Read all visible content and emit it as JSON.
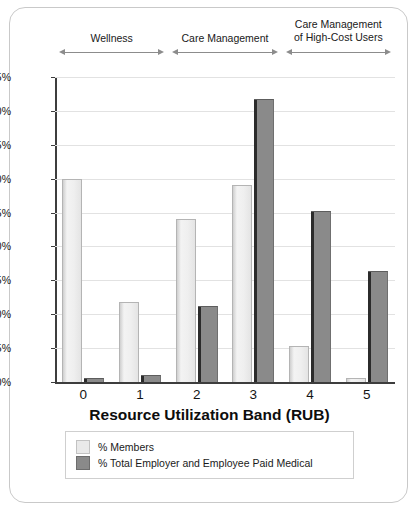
{
  "chart_data": {
    "type": "bar",
    "title": "",
    "xlabel": "Resource Utilization Band (RUB)",
    "ylabel": "",
    "categories": [
      "0",
      "1",
      "2",
      "3",
      "4",
      "5"
    ],
    "ylim": [
      0,
      45
    ],
    "ytick_labels": [
      "45%",
      "40%",
      "35%",
      "30%",
      "25%",
      "20%",
      "15%",
      "10%",
      "5%",
      "0%"
    ],
    "ytick_values": [
      45,
      40,
      35,
      30,
      25,
      20,
      15,
      10,
      5,
      0
    ],
    "grid": true,
    "legend_position": "bottom",
    "series": [
      {
        "name": "% Members",
        "color": "#e9e9e9",
        "values": [
          30.0,
          11.8,
          24.0,
          29.0,
          5.3,
          0.6
        ]
      },
      {
        "name": "% Total Employer and Employee Paid Medical",
        "color": "#8a8a8a",
        "values": [
          0.6,
          1.0,
          11.2,
          41.7,
          25.2,
          16.4
        ]
      }
    ],
    "annotations": [
      {
        "label": "Wellness",
        "spans": [
          "0",
          "1"
        ]
      },
      {
        "label": "Care Management",
        "spans": [
          "2",
          "3"
        ]
      },
      {
        "label": "Care Management\nof High-Cost Users",
        "spans": [
          "4",
          "5"
        ]
      }
    ]
  },
  "brackets": [
    {
      "label": "Wellness"
    },
    {
      "label": "Care Management"
    },
    {
      "label": "Care Management\nof High-Cost Users"
    }
  ],
  "legend": {
    "items": [
      {
        "label": "% Members"
      },
      {
        "label": "% Total Employer and Employee Paid Medical"
      }
    ]
  },
  "axis": {
    "x_title": "Resource Utilization Band (RUB)"
  }
}
